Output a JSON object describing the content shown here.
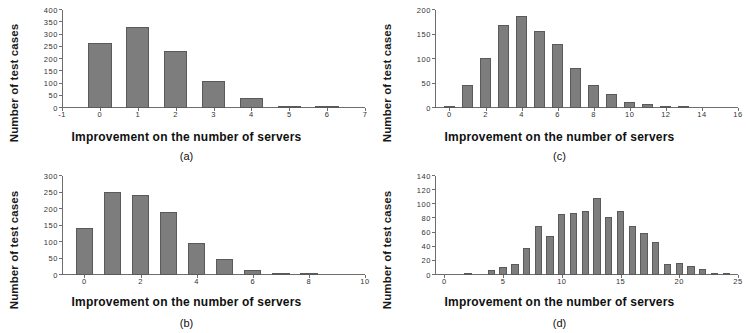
{
  "figure": {
    "ylabel_text": "Number of test cases",
    "xlabel_text": "Improvement on the number of servers",
    "bar_color": "#7d7d7d",
    "bar_edge_color": "#5a5a5a",
    "axis_color": "#6e6e6e",
    "background": "#ffffff"
  },
  "chart_data": [
    {
      "type": "bar",
      "panel": "a",
      "caption": "(a)",
      "title": "",
      "xlabel": "Improvement on the number of servers",
      "ylabel": "Number of test cases",
      "categories": [
        0,
        1,
        2,
        3,
        4,
        5,
        6
      ],
      "values": [
        267,
        332,
        233,
        110,
        40,
        8,
        2
      ],
      "xlim": [
        -1,
        7
      ],
      "ylim": [
        0,
        400
      ],
      "xticks": [
        -1,
        0,
        1,
        2,
        3,
        4,
        5,
        6,
        7
      ],
      "yticks": [
        0,
        50,
        100,
        150,
        200,
        250,
        300,
        350,
        400
      ],
      "grid": false,
      "legend": "none"
    },
    {
      "type": "bar",
      "panel": "c",
      "caption": "(c)",
      "title": "",
      "xlabel": "Improvement on the number of servers",
      "ylabel": "Number of test cases",
      "categories": [
        0,
        1,
        2,
        3,
        4,
        5,
        6,
        7,
        8,
        9,
        10,
        11,
        12,
        13
      ],
      "values": [
        5,
        46,
        103,
        169,
        187,
        158,
        130,
        82,
        47,
        28,
        12,
        8,
        2,
        1
      ],
      "xlim": [
        -0.8,
        16
      ],
      "ylim": [
        0,
        200
      ],
      "xticks": [
        0,
        2,
        4,
        6,
        8,
        10,
        12,
        14,
        16
      ],
      "yticks": [
        0,
        50,
        100,
        150,
        200
      ],
      "grid": false,
      "legend": "none"
    },
    {
      "type": "bar",
      "panel": "b",
      "caption": "(b)",
      "title": "",
      "xlabel": "Improvement on the number of servers",
      "ylabel": "Number of test cases",
      "categories": [
        0,
        1,
        2,
        3,
        4,
        5,
        6,
        7,
        8
      ],
      "values": [
        142,
        251,
        241,
        190,
        96,
        49,
        15,
        5,
        1
      ],
      "xlim": [
        -0.8,
        10
      ],
      "ylim": [
        0,
        300
      ],
      "xticks": [
        0,
        2,
        4,
        6,
        8,
        10
      ],
      "yticks": [
        0,
        50,
        100,
        150,
        200,
        250,
        300
      ],
      "grid": false,
      "legend": "none"
    },
    {
      "type": "bar",
      "panel": "d",
      "caption": "(d)",
      "title": "",
      "xlabel": "Improvement on the number of servers",
      "ylabel": "Number of test cases",
      "categories": [
        0,
        1,
        2,
        3,
        4,
        5,
        6,
        7,
        8,
        9,
        10,
        11,
        12,
        13,
        14,
        15,
        16,
        17,
        18,
        19,
        20,
        21,
        22,
        23,
        24
      ],
      "values": [
        0,
        0,
        1,
        0,
        7,
        11,
        16,
        38,
        69,
        55,
        86,
        88,
        91,
        109,
        82,
        91,
        69,
        60,
        47,
        16,
        17,
        13,
        8,
        3,
        2
      ],
      "xlim": [
        -0.8,
        25
      ],
      "ylim": [
        0,
        140
      ],
      "xticks": [
        0,
        5,
        10,
        15,
        20,
        25
      ],
      "yticks": [
        0,
        20,
        40,
        60,
        80,
        100,
        120,
        140
      ],
      "grid": false,
      "legend": "none"
    }
  ]
}
